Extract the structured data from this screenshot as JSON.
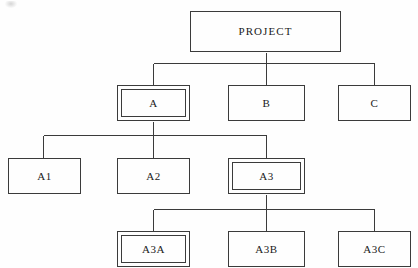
{
  "diagram": {
    "type": "organization-tree",
    "line_color": "#3b3b3b",
    "box_fill": "#fefefe",
    "background": "#fefefe"
  },
  "nodes": {
    "project": {
      "label": "PROJECT",
      "level": 1,
      "emphasis": "single"
    },
    "a": {
      "label": "A",
      "level": 2,
      "emphasis": "double"
    },
    "b": {
      "label": "B",
      "level": 2,
      "emphasis": "single"
    },
    "c": {
      "label": "C",
      "level": 2,
      "emphasis": "single"
    },
    "a1": {
      "label": "A1",
      "level": 3,
      "emphasis": "single"
    },
    "a2": {
      "label": "A2",
      "level": 3,
      "emphasis": "single"
    },
    "a3": {
      "label": "A3",
      "level": 3,
      "emphasis": "double"
    },
    "a3a": {
      "label": "A3A",
      "level": 4,
      "emphasis": "double"
    },
    "a3b": {
      "label": "A3B",
      "level": 4,
      "emphasis": "single"
    },
    "a3c": {
      "label": "A3C",
      "level": 4,
      "emphasis": "single"
    }
  },
  "edges": [
    {
      "from": "project",
      "to": "a"
    },
    {
      "from": "project",
      "to": "b"
    },
    {
      "from": "project",
      "to": "c"
    },
    {
      "from": "a",
      "to": "a1"
    },
    {
      "from": "a",
      "to": "a2"
    },
    {
      "from": "a",
      "to": "a3"
    },
    {
      "from": "a3",
      "to": "a3a"
    },
    {
      "from": "a3",
      "to": "a3b"
    },
    {
      "from": "a3",
      "to": "a3c"
    }
  ]
}
